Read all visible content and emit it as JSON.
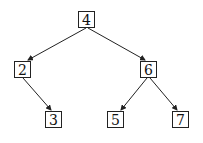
{
  "diagram": {
    "type": "binary-tree",
    "nodes": [
      {
        "id": "n4",
        "label": "4",
        "x": 78,
        "y": 11
      },
      {
        "id": "n2",
        "label": "2",
        "x": 14,
        "y": 61
      },
      {
        "id": "n6",
        "label": "6",
        "x": 140,
        "y": 61
      },
      {
        "id": "n3",
        "label": "3",
        "x": 45,
        "y": 111
      },
      {
        "id": "n5",
        "label": "5",
        "x": 107,
        "y": 111
      },
      {
        "id": "n7",
        "label": "7",
        "x": 172,
        "y": 111
      }
    ],
    "edges": [
      {
        "from": "4",
        "to": "2"
      },
      {
        "from": "4",
        "to": "6"
      },
      {
        "from": "2",
        "to": "3"
      },
      {
        "from": "6",
        "to": "5"
      },
      {
        "from": "6",
        "to": "7"
      }
    ],
    "colors": {
      "stroke": "#222222",
      "background": "#ffffff"
    }
  }
}
